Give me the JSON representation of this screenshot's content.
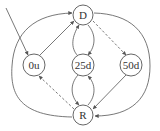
{
  "diagram": {
    "type": "state-machine",
    "nodes": [
      {
        "id": "D",
        "label": "D"
      },
      {
        "id": "0u",
        "label": "0u"
      },
      {
        "id": "25d",
        "label": "25d"
      },
      {
        "id": "50d",
        "label": "50d"
      },
      {
        "id": "R",
        "label": "R"
      }
    ],
    "edges": [
      {
        "from": "start",
        "to": "0u",
        "style": "solid"
      },
      {
        "from": "0u",
        "to": "D",
        "style": "solid"
      },
      {
        "from": "D",
        "to": "50d",
        "style": "dashed"
      },
      {
        "from": "50d",
        "to": "R",
        "style": "solid"
      },
      {
        "from": "R",
        "to": "0u",
        "style": "dashed"
      },
      {
        "from": "D",
        "to": "25d",
        "style": "solid"
      },
      {
        "from": "25d",
        "to": "D",
        "style": "solid"
      },
      {
        "from": "25d",
        "to": "R",
        "style": "solid"
      },
      {
        "from": "R",
        "to": "25d",
        "style": "solid"
      },
      {
        "from": "R",
        "to": "D",
        "style": "solid",
        "route": "outer-left"
      },
      {
        "from": "D",
        "to": "R",
        "style": "solid",
        "route": "outer-right"
      }
    ],
    "colors": {
      "stroke": "#555555",
      "text": "#333333",
      "background": "#ffffff"
    }
  }
}
